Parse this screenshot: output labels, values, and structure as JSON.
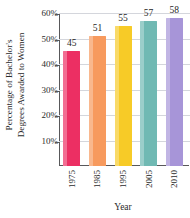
{
  "chart_data": {
    "type": "bar",
    "title": "",
    "xlabel": "Year",
    "ylabel": "Percentage of Bachelor's Degrees Awarded to Women",
    "ylabel_line1": "Percentage of Bachelor's",
    "ylabel_line2": "Degrees Awarded to Women",
    "categories": [
      "1975",
      "1985",
      "1995",
      "2005",
      "2010"
    ],
    "values": [
      45,
      51,
      55,
      57,
      58
    ],
    "value_labels": [
      "45",
      "51",
      "55",
      "57",
      "58"
    ],
    "ylim": [
      0,
      60
    ],
    "ytick_values": [
      10,
      20,
      30,
      40,
      50,
      60
    ],
    "ytick_labels": [
      "10%",
      "20%",
      "30%",
      "40%",
      "50%",
      "60%"
    ],
    "grid": true,
    "legend": "none",
    "bar_colors": [
      "#ec2f63",
      "#f79a5e",
      "#f7cb27",
      "#70b9b3",
      "#a795d8"
    ],
    "axis_color": "#58585a",
    "grid_color": "#d4d6dc"
  }
}
